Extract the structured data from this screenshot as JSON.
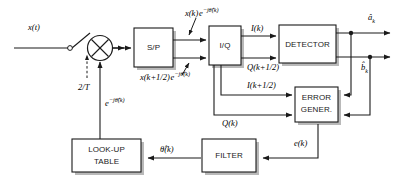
{
  "diagram": {
    "blocks": [
      {
        "id": "sp",
        "label_line1": "S/P",
        "label_line2": ""
      },
      {
        "id": "iq",
        "label_line1": "I/Q",
        "label_line2": ""
      },
      {
        "id": "detector",
        "label_line1": "DETECTOR",
        "label_line2": ""
      },
      {
        "id": "errgen",
        "label_line1": "ERROR",
        "label_line2": "GENER."
      },
      {
        "id": "filter",
        "label_line1": "FILTER",
        "label_line2": ""
      },
      {
        "id": "lut",
        "label_line1": "LOOK-UP",
        "label_line2": "TABLE"
      }
    ],
    "signals": {
      "input": "x(t)",
      "sample_rate": "2/T",
      "sp_out_top": "x(k) e−jθ(k)",
      "sp_out_bottom": "x(k+1/2) e−jθ(k)",
      "iq_out_top": "I(k)",
      "iq_out_q_half": "Q(k+1/2)",
      "iq_out_i_half": "I(k+1/2)",
      "iq_out_q": "Q(k)",
      "det_out_a": "âk",
      "det_out_b": "b̂k",
      "error": "e(k)",
      "phase_est": "θ̂(k)",
      "nco_out": "e−jθ(k)"
    },
    "operators": [
      {
        "id": "mixer",
        "symbol": "⊗",
        "name": "multiplier"
      },
      {
        "id": "switch",
        "name": "sampling-switch"
      }
    ],
    "colors": {
      "line": "#1a1a1a",
      "shadow": "#b9b9b9",
      "background": "#ffffff"
    }
  }
}
